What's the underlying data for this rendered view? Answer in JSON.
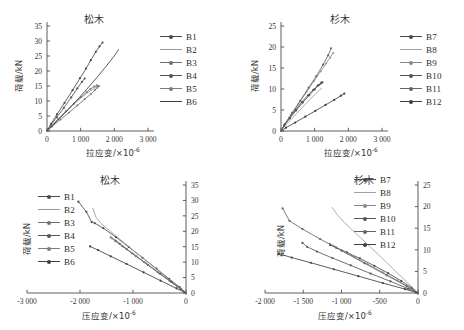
{
  "figure": {
    "panels": [
      {
        "id": "top-left",
        "title": "松木",
        "xlabel": "拉应变/×10",
        "xlabel_exp": "-6",
        "ylabel": "荷载/kN",
        "xticks": [
          "0",
          "1 000",
          "2 000",
          "3 000"
        ],
        "yticks": [
          "0",
          "5",
          "10",
          "15",
          "20",
          "25",
          "30",
          "35"
        ],
        "legend": [
          "B1",
          "B2",
          "B3",
          "B4",
          "B5",
          "B6"
        ]
      },
      {
        "id": "top-right",
        "title": "杉木",
        "xlabel": "拉应变/×10",
        "xlabel_exp": "-6",
        "ylabel": "荷载/kN",
        "xticks": [
          "0",
          "1 000",
          "2 000",
          "3 000"
        ],
        "yticks": [
          "0",
          "5",
          "10",
          "15",
          "20",
          "25"
        ],
        "legend": [
          "B7",
          "B8",
          "B9",
          "B10",
          "B11",
          "B12"
        ]
      },
      {
        "id": "bottom-left",
        "title": "松木",
        "xlabel": "压应变/×10",
        "xlabel_exp": "-6",
        "ylabel": "荷载/kN",
        "xticks": [
          "-3 000",
          "-2 000",
          "-1 000",
          "0"
        ],
        "yticks": [
          "0",
          "5",
          "10",
          "15",
          "20",
          "25",
          "30",
          "35"
        ],
        "legend": [
          "B1",
          "B2",
          "B3",
          "B4",
          "B5",
          "B6"
        ]
      },
      {
        "id": "bottom-right",
        "title": "杉木",
        "xlabel": "压应变/×10",
        "xlabel_exp": "-6",
        "ylabel": "荷载/kN",
        "xticks": [
          "-2 000",
          "-1 500",
          "-1 000",
          "-500",
          "0"
        ],
        "yticks": [
          "0",
          "5",
          "10",
          "15",
          "20",
          "25"
        ],
        "legend": [
          "B7",
          "B8",
          "B9",
          "B10",
          "B11",
          "B12"
        ]
      }
    ]
  },
  "chart_data": [
    {
      "type": "line",
      "id": "top-left",
      "title": "松木",
      "xlabel": "拉应变/×10^-6",
      "ylabel": "荷载/kN",
      "xlim": [
        0,
        3000
      ],
      "ylim": [
        0,
        35
      ],
      "xticks": [
        0,
        1000,
        2000,
        3000
      ],
      "yticks": [
        0,
        5,
        10,
        15,
        20,
        25,
        30,
        35
      ],
      "grid": false,
      "legend_position": "right",
      "series": [
        {
          "name": "B1",
          "color": "#4a4a4a",
          "marker": "dot",
          "x": [
            0,
            120,
            300,
            520,
            760,
            980,
            1160,
            1300,
            1450,
            1560,
            1650
          ],
          "y": [
            0,
            2.4,
            5.6,
            9.4,
            13.6,
            17.6,
            20.8,
            23.6,
            26.4,
            28.2,
            29.5
          ]
        },
        {
          "name": "B2",
          "color": "#9a9a9a",
          "marker": "line",
          "x": [
            0,
            140,
            360,
            600,
            840,
            1060,
            1240,
            1380,
            1480,
            1540
          ],
          "y": [
            0,
            1.7,
            4.2,
            6.9,
            9.4,
            11.5,
            13.0,
            14.0,
            14.7,
            15.1
          ]
        },
        {
          "name": "B3",
          "color": "#6f6f6f",
          "marker": "cross",
          "x": [
            0,
            150,
            400,
            660,
            900,
            1120,
            1300,
            1420,
            1500,
            1545
          ],
          "y": [
            0,
            1.5,
            3.8,
            6.2,
            8.5,
            10.6,
            12.3,
            13.6,
            14.5,
            15.0
          ]
        },
        {
          "name": "B4",
          "color": "#555555",
          "marker": "dot",
          "x": [
            0,
            110,
            290,
            500,
            720,
            900,
            1040,
            1120
          ],
          "y": [
            0,
            1.9,
            4.6,
            7.7,
            11.2,
            14.2,
            16.4,
            17.5
          ]
        },
        {
          "name": "B5",
          "color": "#7d7d7d",
          "marker": "dot",
          "x": [
            0,
            130,
            330,
            560,
            800,
            1010,
            1180,
            1290,
            1400,
            1480
          ],
          "y": [
            0,
            1.6,
            4.0,
            6.6,
            9.1,
            11.3,
            13.0,
            14.0,
            14.8,
            15.2
          ]
        },
        {
          "name": "B6",
          "color": "#3f3f3f",
          "marker": "line",
          "x": [
            0,
            160,
            420,
            700,
            980,
            1240,
            1480,
            1700,
            1900,
            2050,
            2120
          ],
          "y": [
            0,
            1.8,
            4.7,
            8.0,
            11.4,
            14.7,
            17.8,
            20.8,
            23.6,
            25.8,
            27.1
          ]
        }
      ]
    },
    {
      "type": "line",
      "id": "top-right",
      "title": "杉木",
      "xlabel": "拉应变/×10^-6",
      "ylabel": "荷载/kN",
      "xlim": [
        0,
        3000
      ],
      "ylim": [
        0,
        25
      ],
      "xticks": [
        0,
        1000,
        2000,
        3000
      ],
      "yticks": [
        0,
        5,
        10,
        15,
        20,
        25
      ],
      "grid": false,
      "legend_position": "right",
      "series": [
        {
          "name": "B7",
          "color": "#4a4a4a",
          "marker": "dot",
          "x": [
            0,
            90,
            250,
            430,
            620,
            800,
            960,
            1090,
            1180,
            1230
          ],
          "y": [
            0,
            1.4,
            3.1,
            5.0,
            6.9,
            8.5,
            9.8,
            10.8,
            11.3,
            11.6
          ]
        },
        {
          "name": "B8",
          "color": "#a0a0a0",
          "marker": "line",
          "x": [
            0,
            100,
            280,
            480,
            680,
            870,
            1030,
            1140,
            1210
          ],
          "y": [
            0,
            1.1,
            2.6,
            4.3,
            6.0,
            7.6,
            8.9,
            9.7,
            10.2
          ]
        },
        {
          "name": "B9",
          "color": "#8a8a8a",
          "marker": "cross",
          "x": [
            0,
            110,
            300,
            520,
            760,
            980,
            1180,
            1340,
            1460,
            1550
          ],
          "y": [
            0,
            1.6,
            3.9,
            6.5,
            9.3,
            11.9,
            14.2,
            16.1,
            17.5,
            18.6
          ]
        },
        {
          "name": "B10",
          "color": "#555555",
          "marker": "dot",
          "x": [
            0,
            95,
            260,
            450,
            650,
            840,
            1000,
            1120,
            1200
          ],
          "y": [
            0,
            1.3,
            3.0,
            4.9,
            6.8,
            8.5,
            9.9,
            10.9,
            11.5
          ]
        },
        {
          "name": "B11",
          "color": "#666666",
          "marker": "dot",
          "x": [
            0,
            120,
            330,
            570,
            820,
            1050,
            1250,
            1400,
            1490
          ],
          "y": [
            0,
            1.7,
            4.3,
            7.2,
            10.3,
            13.1,
            15.8,
            18.0,
            19.7
          ]
        },
        {
          "name": "B12",
          "color": "#3f3f3f",
          "marker": "dot",
          "x": [
            0,
            150,
            420,
            720,
            1020,
            1320,
            1580,
            1780,
            1880
          ],
          "y": [
            0,
            0.8,
            2.0,
            3.4,
            4.8,
            6.2,
            7.4,
            8.4,
            8.9
          ]
        }
      ]
    },
    {
      "type": "line",
      "id": "bottom-left",
      "title": "松木",
      "xlabel": "压应变/×10^-6",
      "ylabel": "荷载/kN",
      "xlim": [
        -3000,
        0
      ],
      "ylim": [
        0,
        35
      ],
      "xticks": [
        -3000,
        -2000,
        -1000,
        0
      ],
      "yticks": [
        0,
        5,
        10,
        15,
        20,
        25,
        30,
        35
      ],
      "grid": false,
      "legend_position": "left",
      "yaxis_side": "right",
      "series": [
        {
          "name": "B1",
          "color": "#4a4a4a",
          "marker": "dot",
          "x": [
            0,
            -120,
            -320,
            -560,
            -820,
            -1080,
            -1320,
            -1560,
            -1720,
            -1780,
            -1880,
            -2030
          ],
          "y": [
            0,
            1.9,
            4.6,
            7.9,
            11.4,
            14.9,
            18.1,
            21.0,
            22.6,
            23.0,
            26.3,
            29.6
          ]
        },
        {
          "name": "B2",
          "color": "#9a9a9a",
          "marker": "line",
          "x": [
            0,
            -140,
            -380,
            -650,
            -930,
            -1190,
            -1420,
            -1600,
            -1700,
            -1760
          ],
          "y": [
            0,
            1.9,
            5.2,
            9.0,
            12.9,
            16.6,
            19.9,
            22.5,
            24.6,
            27.5
          ]
        },
        {
          "name": "B3",
          "color": "#6f6f6f",
          "marker": "cross",
          "x": [
            0,
            -110,
            -300,
            -520,
            -760,
            -990,
            -1180,
            -1310,
            -1390
          ],
          "y": [
            0,
            1.4,
            3.8,
            6.6,
            9.7,
            12.6,
            15.0,
            16.7,
            17.7
          ]
        },
        {
          "name": "B4",
          "color": "#555555",
          "marker": "dot",
          "x": [
            0,
            -100,
            -280,
            -490,
            -720,
            -940,
            -1120,
            -1250,
            -1330
          ],
          "y": [
            0,
            1.3,
            3.6,
            6.2,
            9.1,
            11.9,
            14.2,
            15.9,
            16.9
          ]
        },
        {
          "name": "B5",
          "color": "#7d7d7d",
          "marker": "dot",
          "x": [
            0,
            -115,
            -310,
            -540,
            -790,
            -1020,
            -1210,
            -1340,
            -1420
          ],
          "y": [
            0,
            1.4,
            3.9,
            6.8,
            10.0,
            12.9,
            15.3,
            17.0,
            18.0
          ]
        },
        {
          "name": "B6",
          "color": "#3f3f3f",
          "marker": "dot",
          "x": [
            0,
            -180,
            -480,
            -800,
            -1120,
            -1420,
            -1660,
            -1810
          ],
          "y": [
            0,
            1.5,
            4.0,
            6.7,
            9.4,
            11.9,
            13.9,
            15.1
          ]
        }
      ]
    },
    {
      "type": "line",
      "id": "bottom-right",
      "title": "杉木",
      "xlabel": "压应变/×10^-6",
      "ylabel": "荷载/kN",
      "xlim": [
        -2000,
        0
      ],
      "ylim": [
        0,
        25
      ],
      "xticks": [
        -2000,
        -1500,
        -1000,
        -500,
        0
      ],
      "yticks": [
        0,
        5,
        10,
        15,
        20,
        25
      ],
      "grid": false,
      "legend_position": "top-right",
      "yaxis_side": "right",
      "series": [
        {
          "name": "B7",
          "color": "#4a4a4a",
          "marker": "dot",
          "x": [
            0,
            -80,
            -220,
            -390,
            -570,
            -760,
            -930,
            -1070,
            -1150
          ],
          "y": [
            0,
            1.2,
            2.8,
            4.6,
            6.3,
            8.0,
            9.4,
            10.5,
            11.1
          ]
        },
        {
          "name": "B8",
          "color": "#a0a0a0",
          "marker": "line",
          "x": [
            0,
            -90,
            -250,
            -430,
            -620,
            -800,
            -960,
            -1060,
            -1120
          ],
          "y": [
            0,
            1.6,
            4.3,
            7.4,
            10.6,
            13.6,
            16.3,
            18.2,
            19.8
          ]
        },
        {
          "name": "B9",
          "color": "#8a8a8a",
          "marker": "cross",
          "x": [
            0,
            -100,
            -270,
            -460,
            -660,
            -840,
            -990,
            -1090,
            -1150
          ],
          "y": [
            0,
            1.1,
            2.9,
            4.8,
            6.7,
            8.4,
            9.8,
            10.8,
            11.4
          ]
        },
        {
          "name": "B10",
          "color": "#555555",
          "marker": "dot",
          "x": [
            0,
            -130,
            -360,
            -620,
            -880,
            -1120,
            -1320,
            -1450,
            -1510
          ],
          "y": [
            0,
            1.0,
            2.7,
            4.5,
            6.4,
            8.1,
            9.6,
            10.7,
            11.6
          ]
        },
        {
          "name": "B11",
          "color": "#666666",
          "marker": "dot",
          "x": [
            0,
            -150,
            -410,
            -700,
            -1000,
            -1280,
            -1510,
            -1680,
            -1770
          ],
          "y": [
            0,
            1.6,
            4.1,
            6.9,
            9.8,
            12.5,
            14.8,
            16.7,
            19.6
          ]
        },
        {
          "name": "B12",
          "color": "#3f3f3f",
          "marker": "dot",
          "x": [
            0,
            -170,
            -460,
            -780,
            -1100,
            -1400,
            -1650,
            -1820
          ],
          "y": [
            0,
            0.9,
            2.3,
            3.9,
            5.5,
            7.0,
            8.2,
            9.1
          ]
        }
      ]
    }
  ]
}
